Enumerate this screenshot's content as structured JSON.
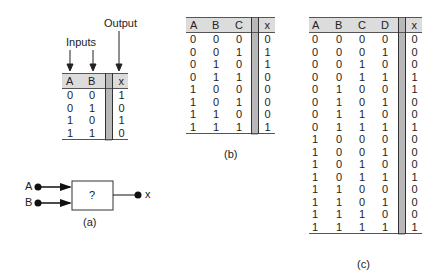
{
  "figure_a": {
    "inputs_label": "Inputs",
    "output_label": "Output",
    "headers": [
      "A",
      "B",
      "x"
    ],
    "rows": [
      [
        "0",
        "0",
        "1"
      ],
      [
        "0",
        "1",
        "0"
      ],
      [
        "1",
        "0",
        "1"
      ],
      [
        "1",
        "1",
        "0"
      ]
    ],
    "block": {
      "input_a": "A",
      "input_b": "B",
      "box_label": "?",
      "output": "x"
    },
    "caption": "(a)"
  },
  "figure_b": {
    "headers": [
      "A",
      "B",
      "C",
      "x"
    ],
    "rows": [
      [
        "0",
        "0",
        "0",
        "0"
      ],
      [
        "0",
        "0",
        "1",
        "1"
      ],
      [
        "0",
        "1",
        "0",
        "1"
      ],
      [
        "0",
        "1",
        "1",
        "0"
      ],
      [
        "1",
        "0",
        "0",
        "0"
      ],
      [
        "1",
        "0",
        "1",
        "0"
      ],
      [
        "1",
        "1",
        "0",
        "0"
      ],
      [
        "1",
        "1",
        "1",
        "1"
      ]
    ],
    "caption": "(b)"
  },
  "figure_c": {
    "headers": [
      "A",
      "B",
      "C",
      "D",
      "x"
    ],
    "rows": [
      [
        "0",
        "0",
        "0",
        "0",
        "0"
      ],
      [
        "0",
        "0",
        "0",
        "1",
        "0"
      ],
      [
        "0",
        "0",
        "1",
        "0",
        "0"
      ],
      [
        "0",
        "0",
        "1",
        "1",
        "1"
      ],
      [
        "0",
        "1",
        "0",
        "0",
        "1"
      ],
      [
        "0",
        "1",
        "0",
        "1",
        "0"
      ],
      [
        "0",
        "1",
        "1",
        "0",
        "0"
      ],
      [
        "0",
        "1",
        "1",
        "1",
        "1"
      ],
      [
        "1",
        "0",
        "0",
        "0",
        "0"
      ],
      [
        "1",
        "0",
        "0",
        "1",
        "0"
      ],
      [
        "1",
        "0",
        "1",
        "0",
        "0"
      ],
      [
        "1",
        "0",
        "1",
        "1",
        "1"
      ],
      [
        "1",
        "1",
        "0",
        "0",
        "0"
      ],
      [
        "1",
        "1",
        "0",
        "1",
        "0"
      ],
      [
        "1",
        "1",
        "1",
        "0",
        "0"
      ],
      [
        "1",
        "1",
        "1",
        "1",
        "1"
      ]
    ],
    "caption": "(c)"
  }
}
